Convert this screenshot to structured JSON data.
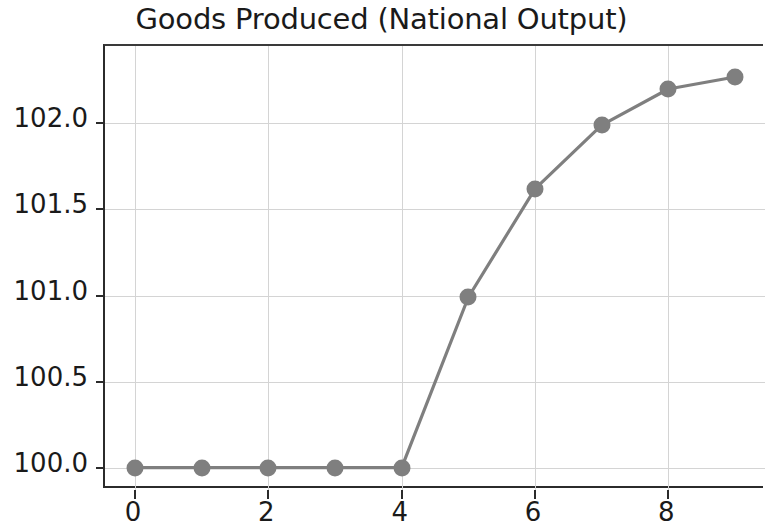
{
  "chart_data": {
    "type": "line",
    "title": "Goods Produced (National Output)",
    "xlabel": "",
    "ylabel": "",
    "x": [
      0,
      1,
      2,
      3,
      4,
      5,
      6,
      7,
      8,
      9
    ],
    "values": [
      100.0,
      100.0,
      100.0,
      100.0,
      100.0,
      100.99,
      101.62,
      101.99,
      102.2,
      102.27
    ],
    "series": [
      {
        "name": "Goods Produced",
        "values": [
          100.0,
          100.0,
          100.0,
          100.0,
          100.0,
          100.99,
          101.62,
          101.99,
          102.2,
          102.27
        ],
        "color": "#7f7f7f",
        "marker": "circle"
      }
    ],
    "xlim": [
      -0.45,
      9.45
    ],
    "ylim": [
      99.87,
      102.45
    ],
    "xticks": [
      0,
      2,
      4,
      6,
      8
    ],
    "xtick_labels": [
      "0",
      "2",
      "4",
      "6",
      "8"
    ],
    "yticks": [
      100.0,
      100.5,
      101.0,
      101.5,
      102.0
    ],
    "ytick_labels": [
      "100.0",
      "100.5",
      "101.0",
      "101.5",
      "102.0"
    ],
    "grid": true,
    "grid_color": "#d4d4d4",
    "legend": null,
    "legend_position": "none",
    "annotations": [],
    "background": "#ffffff",
    "axis_color": "#2b2b2b",
    "right_spine_visible": false
  }
}
